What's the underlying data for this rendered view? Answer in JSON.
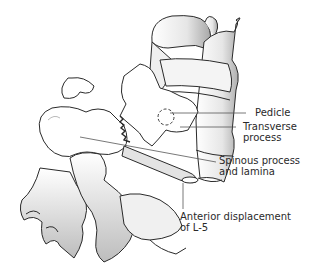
{
  "diagram": {
    "labels": [
      {
        "id": "pedicle",
        "lines": [
          "Pedicle"
        ]
      },
      {
        "id": "transverse",
        "lines": [
          "Transverse",
          "process"
        ]
      },
      {
        "id": "spinous",
        "lines": [
          "Spinous process",
          "and lamina"
        ]
      },
      {
        "id": "anterior",
        "lines": [
          "Anterior displacement",
          "of L-5"
        ]
      }
    ]
  },
  "colors": {
    "outline": "#2a2a2a",
    "bone_fill": "#ffffff",
    "shade_light": "#d8d8d8",
    "shade_dark": "#9a9a9a",
    "leader_line": "#555555"
  }
}
